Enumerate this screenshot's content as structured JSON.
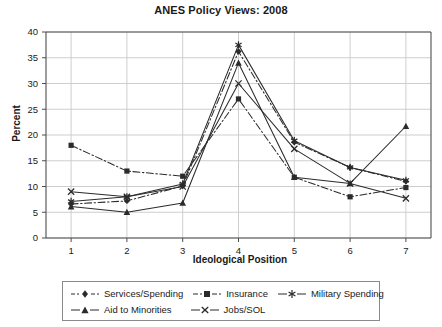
{
  "chart_data": {
    "type": "line",
    "title": "ANES Policy Views: 2008",
    "xlabel": "Ideological Position",
    "ylabel": "Percent",
    "categories": [
      1,
      2,
      3,
      4,
      5,
      6,
      7
    ],
    "x": [
      1,
      2,
      3,
      4,
      5,
      6,
      7
    ],
    "xlim": [
      0.55,
      7.45
    ],
    "ylim": [
      0,
      40
    ],
    "xticks": [
      "1",
      "2",
      "3",
      "4",
      "5",
      "6",
      "7"
    ],
    "yticks": [
      "0",
      "5",
      "10",
      "15",
      "20",
      "25",
      "30",
      "35",
      "40"
    ],
    "grid": true,
    "legend_position": "bottom",
    "series": [
      {
        "name": "Services/Spending",
        "marker": "diamond",
        "dash": "dashdot",
        "values": [
          6.6,
          7.2,
          10.1,
          36.2,
          18.6,
          13.7,
          11.0
        ]
      },
      {
        "name": "Insurance",
        "marker": "square",
        "dash": "dashdot",
        "values": [
          18.0,
          13.0,
          12.0,
          27.0,
          11.8,
          8.0,
          9.8
        ]
      },
      {
        "name": "Military Spending",
        "marker": "asterisk",
        "dash": "solid",
        "values": [
          7.1,
          8.0,
          10.5,
          37.5,
          18.9,
          13.7,
          11.2
        ]
      },
      {
        "name": "Aid to Minorities",
        "marker": "triangle",
        "dash": "solid",
        "values": [
          6.1,
          5.0,
          6.8,
          34.0,
          11.8,
          10.6,
          21.7
        ]
      },
      {
        "name": "Jobs/SOL",
        "marker": "cross",
        "dash": "solid",
        "values": [
          9.0,
          8.0,
          10.0,
          30.0,
          17.3,
          10.6,
          7.7
        ]
      }
    ]
  },
  "legend": {
    "items": [
      {
        "label": "Services/Spending",
        "marker": "diamond-marker-icon"
      },
      {
        "label": "Insurance",
        "marker": "square-marker-icon"
      },
      {
        "label": "Military Spending",
        "marker": "asterisk-marker-icon"
      },
      {
        "label": "Aid to Minorities",
        "marker": "triangle-marker-icon"
      },
      {
        "label": "Jobs/SOL",
        "marker": "cross-marker-icon"
      }
    ]
  },
  "style": {
    "line_color": "#2b2b2b",
    "grid_color": "#c8c8c8",
    "axis_color": "#4d4d4d",
    "background": "#ffffff"
  }
}
